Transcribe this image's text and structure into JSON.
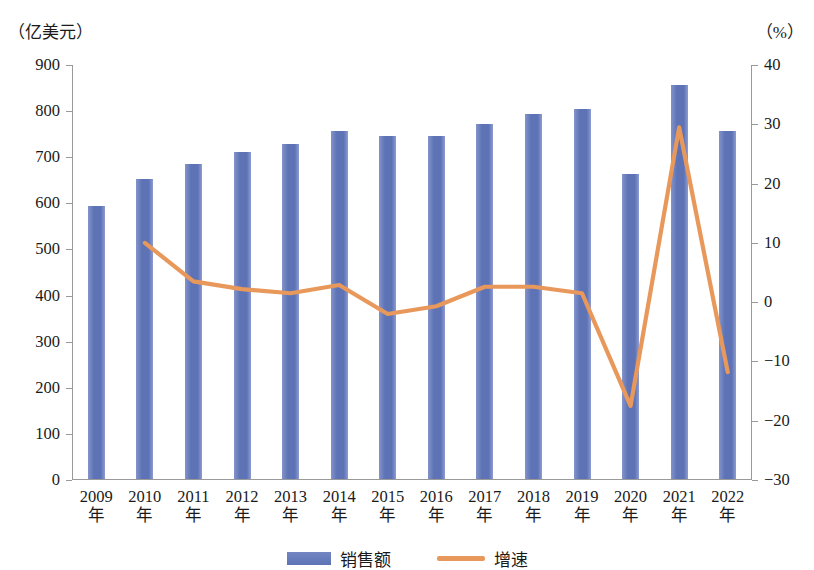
{
  "chart_data": {
    "type": "bar",
    "title": "",
    "xlabel": "",
    "ylabel": "（亿美元）",
    "y2label": "（%）",
    "categories": [
      "2009年",
      "2010年",
      "2011年",
      "2012年",
      "2013年",
      "2014年",
      "2015年",
      "2016年",
      "2017年",
      "2018年",
      "2019年",
      "2020年",
      "2021年",
      "2022年"
    ],
    "x_tick_years": [
      "2009",
      "2010",
      "2011",
      "2012",
      "2013",
      "2014",
      "2015",
      "2016",
      "2017",
      "2018",
      "2019",
      "2020",
      "2021",
      "2022"
    ],
    "x_tick_suffix": "年",
    "ylim": [
      0,
      900
    ],
    "y2lim": [
      -30,
      40
    ],
    "y_ticks": [
      0,
      100,
      200,
      300,
      400,
      500,
      600,
      700,
      800,
      900
    ],
    "y2_ticks": [
      -30,
      -20,
      -10,
      0,
      10,
      20,
      30,
      40
    ],
    "grid": false,
    "legend_position": "bottom-center",
    "series": [
      {
        "name": "销售额",
        "type": "bar",
        "axis": "left",
        "unit": "亿美元",
        "color": "#5d73b6",
        "values": [
          592,
          651,
          684,
          709,
          727,
          754,
          744,
          744,
          770,
          791,
          802,
          662,
          855,
          754
        ]
      },
      {
        "name": "增速",
        "type": "line",
        "axis": "right",
        "unit": "%",
        "color": "#e8985a",
        "values": [
          null,
          10.0,
          3.5,
          2.2,
          1.5,
          2.9,
          -2.0,
          -0.7,
          2.6,
          2.6,
          1.5,
          -17.5,
          29.5,
          -11.8
        ]
      }
    ],
    "legend": [
      {
        "label": "销售额",
        "marker": "bar",
        "color": "#5d73b6"
      },
      {
        "label": "增速",
        "marker": "line",
        "color": "#e8985a"
      }
    ]
  }
}
